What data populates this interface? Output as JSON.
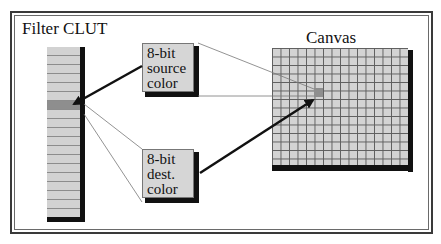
{
  "diagram": {
    "clut": {
      "title": "Filter CLUT",
      "entries": 19,
      "highlight_index": 6
    },
    "source_box": {
      "lines": [
        "8-bit",
        "source",
        "color"
      ]
    },
    "dest_box": {
      "lines": [
        "8-bit",
        "dest.",
        "color"
      ]
    },
    "canvas": {
      "title": "Canvas",
      "columns": 16,
      "rows": 14,
      "highlight_cell": {
        "col": 5,
        "row": 5
      }
    },
    "arrows": [
      {
        "from": "source_box",
        "to": "clut_highlight",
        "style": "thick"
      },
      {
        "from": "dest_box",
        "to": "canvas_highlight",
        "style": "thick"
      }
    ],
    "connector_lines": [
      {
        "from": "source_box",
        "to": "canvas_highlight",
        "style": "thin"
      },
      {
        "from": "clut_highlight",
        "to": "dest_box",
        "style": "thin"
      }
    ],
    "colors": {
      "fill": "#d3d3d3",
      "highlight": "#8e8e8e",
      "shadow": "#111111",
      "frame": "#3a3a3a"
    }
  }
}
